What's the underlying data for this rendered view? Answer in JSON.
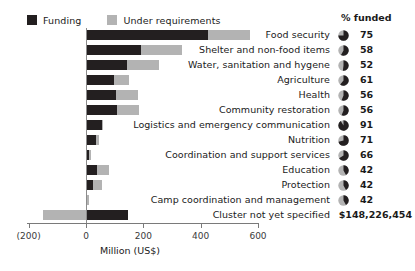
{
  "legend": {
    "items": [
      {
        "label": "Funding",
        "color": "#231f20",
        "key": "funding"
      },
      {
        "label": "Under requirements",
        "color": "#b3b3b3",
        "key": "under_requirements"
      }
    ]
  },
  "pct_column": {
    "header": "% funded"
  },
  "axis": {
    "title": "Million (US$)",
    "tick_labels": [
      "(200)",
      "0",
      "200",
      "400",
      "600"
    ],
    "tick_values": [
      -200,
      0,
      200,
      400,
      600
    ]
  },
  "chart_data": {
    "type": "bar",
    "orientation": "horizontal",
    "stacked": true,
    "title": "",
    "xlabel": "Million (US$)",
    "ylabel": "",
    "xlim": [
      -200,
      600
    ],
    "grid": false,
    "legend_position": "top-left",
    "categories": [
      "Food security",
      "Shelter and non-food items",
      "Water, sanitation and hygene",
      "Agriculture",
      "Health",
      "Community restoration",
      "Logistics and emergency communication",
      "Nutrition",
      "Coordination and support services",
      "Education",
      "Protection",
      "Camp coordination and management",
      "Cluster not yet specified"
    ],
    "series": [
      {
        "name": "Funding",
        "color": "#231f20",
        "values": [
          425,
          192,
          143,
          97,
          104,
          108,
          56,
          35,
          12,
          38,
          24,
          5,
          148
        ]
      },
      {
        "name": "Under requirements",
        "color": "#b3b3b3",
        "values": [
          147,
          143,
          112,
          54,
          77,
          77,
          5,
          11,
          4,
          41,
          32,
          3,
          -150
        ]
      }
    ],
    "percent_funded": [
      75,
      58,
      52,
      61,
      56,
      56,
      91,
      71,
      66,
      42,
      42,
      42,
      null
    ],
    "value_labels": [
      null,
      null,
      null,
      null,
      null,
      null,
      null,
      null,
      null,
      null,
      null,
      null,
      "$148,226,454"
    ]
  },
  "rows": [
    {
      "label": "Food security",
      "funding": 425,
      "under": 147,
      "pct": "75",
      "pie": 75,
      "money": null
    },
    {
      "label": "Shelter and non-food items",
      "funding": 192,
      "under": 143,
      "pct": "58",
      "pie": 58,
      "money": null
    },
    {
      "label": "Water, sanitation and hygene",
      "funding": 143,
      "under": 112,
      "pct": "52",
      "pie": 52,
      "money": null
    },
    {
      "label": "Agriculture",
      "funding": 97,
      "under": 54,
      "pct": "61",
      "pie": 61,
      "money": null
    },
    {
      "label": "Health",
      "funding": 104,
      "under": 77,
      "pct": "56",
      "pie": 56,
      "money": null
    },
    {
      "label": "Community restoration",
      "funding": 108,
      "under": 77,
      "pct": "56",
      "pie": 56,
      "money": null
    },
    {
      "label": "Logistics and emergency communication",
      "funding": 56,
      "under": 5,
      "pct": "91",
      "pie": 91,
      "money": null
    },
    {
      "label": "Nutrition",
      "funding": 35,
      "under": 11,
      "pct": "71",
      "pie": 71,
      "money": null
    },
    {
      "label": "Coordination and support services",
      "funding": 12,
      "under": 4,
      "pct": "66",
      "pie": 66,
      "money": null
    },
    {
      "label": "Education",
      "funding": 38,
      "under": 41,
      "pct": "42",
      "pie": 42,
      "money": null
    },
    {
      "label": "Protection",
      "funding": 24,
      "under": 32,
      "pct": "42",
      "pie": 42,
      "money": null
    },
    {
      "label": "Camp coordination and management",
      "funding": 5,
      "under": 3,
      "pct": "42",
      "pie": 42,
      "money": null
    },
    {
      "label": "Cluster not yet specified",
      "funding": 148,
      "under": -150,
      "pct": null,
      "pie": null,
      "money": "$148,226,454"
    }
  ]
}
